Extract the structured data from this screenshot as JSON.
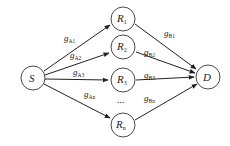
{
  "diagram": {
    "type": "relay-network",
    "nodes": {
      "source": {
        "label": "S",
        "sub": ""
      },
      "destination": {
        "label": "D",
        "sub": ""
      },
      "relays": [
        {
          "label": "R",
          "sub": "1"
        },
        {
          "label": "R",
          "sub": "2"
        },
        {
          "label": "R",
          "sub": "3"
        },
        {
          "label": "R",
          "sub": "n"
        }
      ],
      "ellipsis": "..."
    },
    "edges": {
      "source_to_relay": [
        {
          "label": "g",
          "sub": "A1"
        },
        {
          "label": "g",
          "sub": "A2"
        },
        {
          "label": "g",
          "sub": "A3"
        },
        {
          "label": "g",
          "sub": "An"
        }
      ],
      "relay_to_destination": [
        {
          "label": "g",
          "sub": "B1"
        },
        {
          "label": "g",
          "sub": "B2"
        },
        {
          "label": "g",
          "sub": "B3"
        },
        {
          "label": "g",
          "sub": "Bn"
        }
      ]
    }
  }
}
